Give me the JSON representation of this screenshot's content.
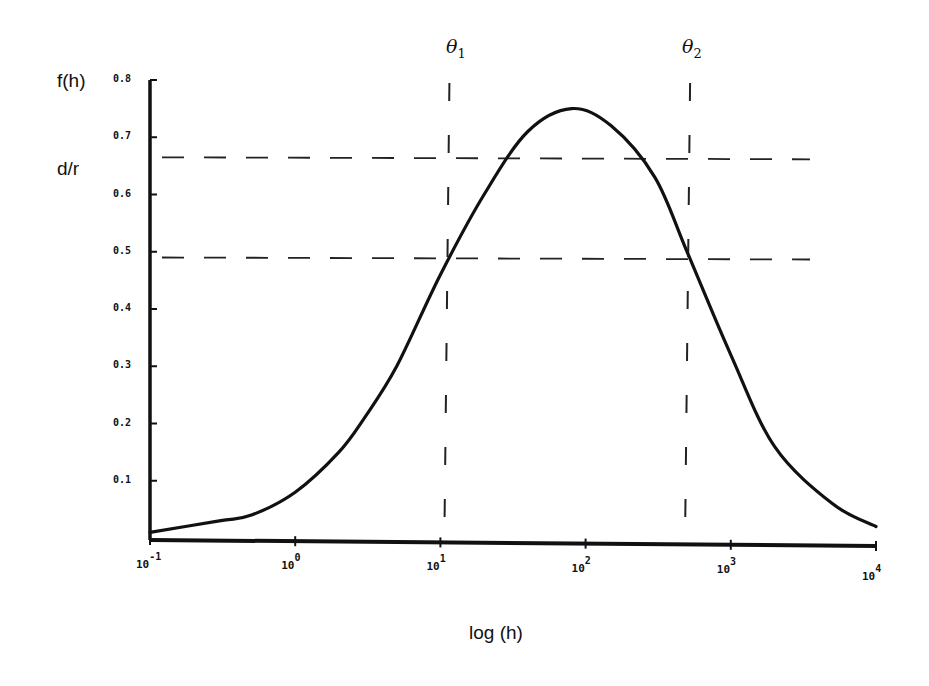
{
  "chart_data": {
    "type": "line",
    "title": "",
    "ylabel_lines": [
      "f(h)",
      "d/r"
    ],
    "xlabel": "log (h)",
    "x_scale": "log",
    "xlim": [
      0.1,
      10000
    ],
    "ylim": [
      0,
      0.8
    ],
    "x_ticks": [
      {
        "base": "10",
        "exp": "-1"
      },
      {
        "base": "10",
        "exp": "0"
      },
      {
        "base": "10",
        "exp": "1"
      },
      {
        "base": "10",
        "exp": "2"
      },
      {
        "base": "10",
        "exp": "3"
      },
      {
        "base": "10",
        "exp": "4"
      }
    ],
    "y_ticks": [
      "0.1",
      "0.2",
      "0.3",
      "0.4",
      "0.5",
      "0.6",
      "0.7",
      "0.8"
    ],
    "grid": false,
    "legend": null,
    "series": [
      {
        "name": "f(h)",
        "style": "solid",
        "x": [
          0.1,
          0.3,
          0.5,
          1,
          2,
          3,
          5,
          10,
          20,
          40,
          80,
          150,
          300,
          500,
          1000,
          2000,
          5000,
          10000
        ],
        "y": [
          0.01,
          0.03,
          0.04,
          0.08,
          0.15,
          0.21,
          0.3,
          0.46,
          0.6,
          0.71,
          0.75,
          0.72,
          0.63,
          0.5,
          0.32,
          0.16,
          0.06,
          0.02
        ]
      }
    ],
    "annotations": {
      "vertical_lines": [
        {
          "label": "θ",
          "subscript": "1",
          "x": 11,
          "style": "dashed"
        },
        {
          "label": "θ",
          "subscript": "2",
          "x": 500,
          "style": "dashed"
        }
      ],
      "horizontal_lines": [
        {
          "y": 0.665,
          "style": "dashed"
        },
        {
          "y": 0.49,
          "style": "dashed"
        }
      ]
    }
  },
  "labels": {
    "y_title_1": "f(h)",
    "y_title_2": "d/r",
    "x_title": "log (h)",
    "theta1": "θ",
    "theta1_sub": "1",
    "theta2": "θ",
    "theta2_sub": "2"
  }
}
